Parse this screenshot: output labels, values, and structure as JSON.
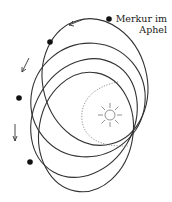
{
  "diagram": {
    "label_line1": "Merkur im",
    "label_line2": "Aphel",
    "center_body": "sun-icon",
    "orbit_count": 4,
    "colors": {
      "line": "#333333",
      "dotted": "#777777"
    }
  }
}
